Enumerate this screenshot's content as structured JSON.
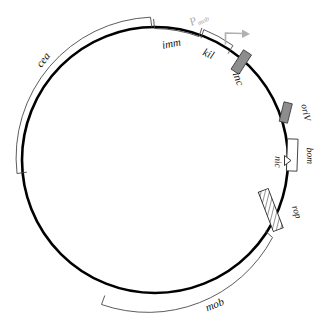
{
  "figure": {
    "type": "plasmid-map",
    "title": "",
    "width": 323,
    "height": 325,
    "background_color": "#ffffff",
    "backbone": {
      "name": "circular-plasmid-backbone",
      "shape": "circle",
      "center_x": 155,
      "center_y": 160,
      "radius": 133,
      "stroke_color": "#000000"
    }
  },
  "features": [
    {
      "id": "cea",
      "label": "cea",
      "style": "outer-arc-bracket",
      "color": "#4a4a4a",
      "label_x": 46,
      "label_y": 62,
      "label_rotation": -52
    },
    {
      "id": "imm",
      "label": "imm",
      "style": "outer-arc-bracket",
      "color": "#4a4a4a",
      "label_x": 172,
      "label_y": 45,
      "label_rotation": -11
    },
    {
      "id": "kil",
      "label": "kil",
      "style": "outer-arc-bracket",
      "color": "#4a4a4a",
      "label_x": 206,
      "label_y": 54,
      "label_rotation": 22
    },
    {
      "id": "inc",
      "label": "inc",
      "style": "filled-box",
      "color": "#8d8d8d",
      "label_x": 235,
      "label_y": 78,
      "label_rotation": 68
    },
    {
      "id": "oriV",
      "label": "oriV",
      "style": "filled-box",
      "color": "#8d8d8d",
      "label_x": 305,
      "label_y": 112,
      "label_rotation": 78
    },
    {
      "id": "bom",
      "label": "bom",
      "style": "open-box",
      "color": "#333333",
      "label_x": 306,
      "label_y": 155,
      "label_rotation": 88
    },
    {
      "id": "nic",
      "label": "nic",
      "style": "triangle-marker",
      "color": "#222222",
      "label_x": 274,
      "label_y": 162,
      "label_rotation": 88
    },
    {
      "id": "rop",
      "label": "rop",
      "style": "hatched-box",
      "color": "#2b2b2b",
      "label_x": 295,
      "label_y": 212,
      "label_rotation": 72
    },
    {
      "id": "mob",
      "label": "mob",
      "style": "outer-arc-bracket",
      "color": "#4a4a4a",
      "label_x": 215,
      "label_y": 305,
      "label_rotation": -24
    }
  ],
  "promoter": {
    "id": "promoter-P",
    "label_main": "P",
    "label_sub": "mob",
    "color": "#a8a8a8",
    "label_x": 201,
    "label_y": 22,
    "label_rotation": -28,
    "arrow_name": "promoter-bent-arrow",
    "arrow_direction": "clockwise"
  }
}
